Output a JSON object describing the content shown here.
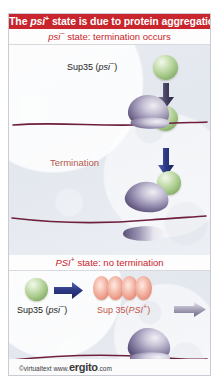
{
  "figure": {
    "title": {
      "prefix": "The ",
      "italic": "psi",
      "superscript": "+",
      "suffix": " state is due to protein aggregation",
      "background_color": "#c8252c",
      "text_color": "#ffffff"
    },
    "footer": {
      "copyright": "©virtualtext",
      "www": "www.",
      "brand": "ergito",
      "tld": ".com"
    },
    "colors": {
      "accent_red": "#c8252c",
      "panel_background": "#e8ebf1",
      "mrna_line": "#6e1f3c",
      "sup35_green": "#a9cb8c",
      "aggregate_pink": "#ec9d8b",
      "ribosome_purple": "#6b5f84",
      "arrow_blue": "#2e3a86",
      "termination_text": "#b4594d"
    },
    "sections": [
      {
        "id": "psi-minus",
        "header": {
          "italic": "psi",
          "superscript": "−",
          "rest": " state: termination occurs"
        },
        "labels": {
          "sup35": {
            "prefix": "Sup35 (",
            "italic": "psi",
            "superscript": "−",
            "suffix": ")"
          },
          "termination": "Termination"
        },
        "icons": [
          "sup35-green-sphere",
          "arrow-down-dark-icon",
          "mrna-strand",
          "ribosome-assembled",
          "arrow-down-blue-icon",
          "ribosome-large-subunit",
          "ribosome-small-subunit"
        ]
      },
      {
        "id": "psi-plus",
        "header": {
          "italic": "PSI",
          "superscript": "+",
          "rest": " state: no termination"
        },
        "labels": {
          "sup35_monomer": {
            "prefix": "Sup35 (",
            "italic": "psi",
            "superscript": "−",
            "suffix": ")"
          },
          "sup35_aggregate": {
            "prefix": "Sup 35(",
            "italic": "PSI",
            "superscript": "+",
            "suffix": ")"
          }
        },
        "aggregate_unit_count": 4,
        "icons": [
          "sup35-green-sphere",
          "arrow-right-blue-icon",
          "sup35-aggregate",
          "arrow-right-grey-icon",
          "mrna-strand",
          "ribosome-assembled"
        ]
      }
    ]
  }
}
